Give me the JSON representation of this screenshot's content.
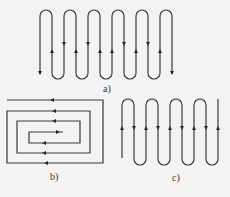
{
  "figure": {
    "panels": [
      {
        "id": "a",
        "label": "a)",
        "pattern": "serpentine-vertical",
        "description": "Zig-zag path with 6 U-loops, entering and exiting downward"
      },
      {
        "id": "b",
        "label": "b)",
        "pattern": "rectangular-spiral",
        "description": "Rectangular inward spiral path with leftward/rightward arrows"
      },
      {
        "id": "c",
        "label": "c)",
        "pattern": "serpentine-vertical",
        "description": "Zig-zag path with alternating U-loops, entering upward, exiting upward"
      }
    ]
  }
}
